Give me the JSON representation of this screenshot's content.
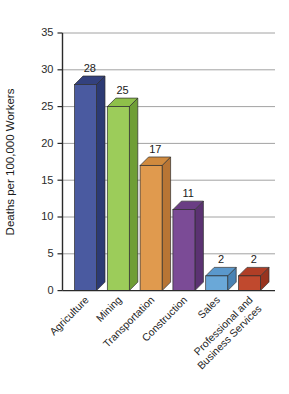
{
  "chart_data": {
    "type": "bar",
    "title": "",
    "subtitle": "",
    "xlabel": "",
    "ylabel": "Deaths per 100,000 Workers",
    "ylim": [
      0,
      35
    ],
    "ytick_step": 5,
    "yticks": [
      "0",
      "5",
      "10",
      "15",
      "20",
      "25",
      "30",
      "35"
    ],
    "grid": true,
    "legend": "none",
    "style": "3d-bars",
    "categories": [
      "Agriculture",
      "Mining",
      "Transportation",
      "Construction",
      "Sales",
      "Professional and Business Services"
    ],
    "category_lines": [
      [
        "Agriculture"
      ],
      [
        "Mining"
      ],
      [
        "Transportation"
      ],
      [
        "Construction"
      ],
      [
        "Sales"
      ],
      [
        "Professional and",
        "Business Services"
      ]
    ],
    "values": [
      28,
      25,
      17,
      11,
      2,
      2
    ],
    "value_labels": [
      "28",
      "25",
      "17",
      "11",
      "2",
      "2"
    ],
    "colors": {
      "agriculture_front": "#4a5aa0",
      "agriculture_top": "#33417e",
      "agriculture_side": "#2c3a74",
      "mining_front": "#9ccc5a",
      "mining_top": "#8ec04a",
      "mining_side": "#6f9e36",
      "transportation_front": "#e09a4e",
      "transportation_top": "#d08a3e",
      "transportation_side": "#b87534",
      "construction_front": "#7b4b96",
      "construction_top": "#6a3d84",
      "construction_side": "#5b3272",
      "sales_front": "#6aa8d8",
      "sales_top": "#5a98cc",
      "sales_side": "#4a83b4",
      "professional_front": "#c0492e",
      "professional_top": "#b03e26",
      "professional_side": "#98341f",
      "gridline": "#8a8a8a",
      "axis": "#2a2a2a",
      "background": "#ffffff",
      "text": "#1a1a1a"
    }
  }
}
